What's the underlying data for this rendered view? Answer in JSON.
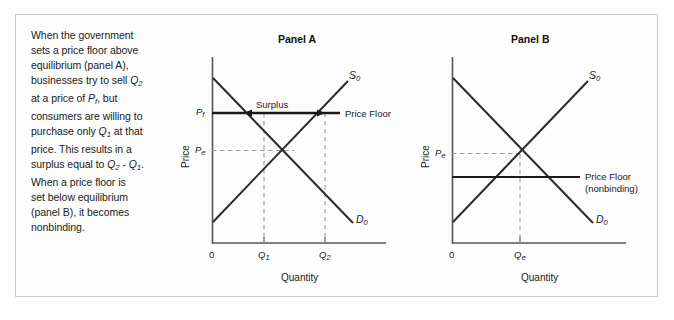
{
  "figure": {
    "caption": {
      "lines": [
        "When the government",
        "sets a price floor above",
        "equilibrium (panel A),",
        "businesses try to sell Q2",
        "at a price of Pf, but",
        "consumers are willing to",
        "purchase only Q1 at that",
        "price. This results in a",
        "surplus equal to Q2 - Q1.",
        "When a price floor is",
        "set below equilibrium",
        "(panel B), it becomes",
        "nonbinding."
      ],
      "full_text": "When the government sets a price floor above equilibrium (panel A), businesses try to sell Q2 at a price of Pf, but consumers are willing to purchase only Q1 at that price. This results in a surplus equal to Q2 - Q1. When a price floor is set below equilibrium (panel B), it becomes nonbinding."
    },
    "colors": {
      "frame_border": "#c9cbcd",
      "curve": "#2b2b2b",
      "axis": "#555555",
      "price_floor": "#1a1a1a",
      "dashed_guide": "#8c8c8c",
      "text": "#1b1b1b",
      "background": "#ffffff"
    }
  },
  "chart_data": [
    {
      "type": "line",
      "id": "panel-a",
      "title": "Panel A",
      "xlabel": "Quantity",
      "ylabel": "Price",
      "grid": false,
      "legend": "inline-curve-labels",
      "origin_label": "0",
      "series": [
        {
          "name": "D0",
          "label": "D0",
          "label_base": "D",
          "label_sub": "0",
          "type": "demand",
          "slope": "downward",
          "points": [
            [
              0.04,
              0.93
            ],
            [
              0.83,
              0.15
            ]
          ]
        },
        {
          "name": "S0",
          "label": "S0",
          "label_base": "S",
          "label_sub": "0",
          "type": "supply",
          "slope": "upward",
          "points": [
            [
              0.04,
              0.15
            ],
            [
              0.8,
              0.9
            ]
          ]
        }
      ],
      "reference_lines": [
        {
          "name": "price-floor",
          "label": "Price Floor",
          "orientation": "horizontal",
          "price_level": "Pf",
          "y_value": 0.7,
          "binding": true
        }
      ],
      "price_ticks": [
        {
          "label": "Pf",
          "base": "P",
          "sub": "f",
          "y_value": 0.7
        },
        {
          "label": "Pe",
          "base": "P",
          "sub": "e",
          "y_value": 0.52
        }
      ],
      "quantity_ticks": [
        {
          "label": "Q1",
          "base": "Q",
          "sub": "1",
          "x_value": 0.295
        },
        {
          "label": "Q2",
          "base": "Q",
          "sub": "2",
          "x_value": 0.645
        }
      ],
      "annotations": [
        {
          "name": "surplus",
          "label": "Surplus",
          "type": "double-arrow",
          "from_x": 0.295,
          "to_x": 0.645,
          "at_y": 0.7,
          "meaning": "Q2 - Q1"
        }
      ]
    },
    {
      "type": "line",
      "id": "panel-b",
      "title": "Panel B",
      "xlabel": "Quantity",
      "ylabel": "Price",
      "grid": false,
      "legend": "inline-curve-labels",
      "origin_label": "0",
      "series": [
        {
          "name": "D0",
          "label": "D0",
          "label_base": "D",
          "label_sub": "0",
          "type": "demand",
          "slope": "downward",
          "points": [
            [
              0.04,
              0.93
            ],
            [
              0.83,
              0.15
            ]
          ]
        },
        {
          "name": "S0",
          "label": "S0",
          "label_base": "S",
          "label_sub": "0",
          "type": "supply",
          "slope": "upward",
          "points": [
            [
              0.04,
              0.15
            ],
            [
              0.8,
              0.9
            ]
          ]
        }
      ],
      "reference_lines": [
        {
          "name": "price-floor",
          "label": "Price Floor",
          "sublabel": "(nonbinding)",
          "orientation": "horizontal",
          "y_value": 0.38,
          "binding": false
        }
      ],
      "price_ticks": [
        {
          "label": "Pe",
          "base": "P",
          "sub": "e",
          "y_value": 0.52
        }
      ],
      "quantity_ticks": [
        {
          "label": "Qe",
          "base": "Q",
          "sub": "e",
          "x_value": 0.4
        }
      ],
      "annotations": []
    }
  ]
}
